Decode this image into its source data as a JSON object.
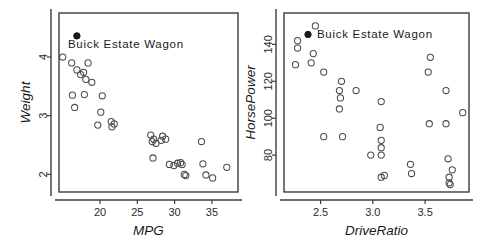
{
  "figure": {
    "background_color": "#ffffff",
    "point_stroke_color": "#4a4a4a",
    "highlight_color": "#1a1a1a",
    "axis_color": "#3c3c3c"
  },
  "chart_data": [
    {
      "type": "scatter",
      "title": "",
      "xlabel": "MPG",
      "ylabel": "Weight",
      "xlim": [
        14.5,
        38.5
      ],
      "ylim": [
        1.7,
        4.75
      ],
      "xticks": [
        20,
        25,
        30,
        35
      ],
      "yticks": [
        2,
        3,
        4
      ],
      "grid": false,
      "legend": {
        "label": "Buick Estate Wagon",
        "marker": "filled-circle",
        "position": "top-left-inside",
        "marker_below_text": true
      },
      "annotations": [
        {
          "label": "Buick Estate Wagon",
          "x": 16.9,
          "y": 4.36,
          "marker": "filled-circle"
        }
      ],
      "points": [
        {
          "x": 15.0,
          "y": 4.0
        },
        {
          "x": 16.2,
          "y": 3.9
        },
        {
          "x": 16.9,
          "y": 3.78
        },
        {
          "x": 17.4,
          "y": 3.7
        },
        {
          "x": 17.8,
          "y": 3.74
        },
        {
          "x": 18.4,
          "y": 3.9
        },
        {
          "x": 18.1,
          "y": 3.62
        },
        {
          "x": 18.9,
          "y": 3.57
        },
        {
          "x": 16.3,
          "y": 3.35
        },
        {
          "x": 17.9,
          "y": 3.36
        },
        {
          "x": 16.6,
          "y": 3.14
        },
        {
          "x": 20.3,
          "y": 3.34
        },
        {
          "x": 20.1,
          "y": 3.06
        },
        {
          "x": 19.7,
          "y": 2.84
        },
        {
          "x": 21.5,
          "y": 2.9
        },
        {
          "x": 21.9,
          "y": 2.86
        },
        {
          "x": 21.6,
          "y": 2.81
        },
        {
          "x": 26.8,
          "y": 2.67
        },
        {
          "x": 27.2,
          "y": 2.6
        },
        {
          "x": 27.0,
          "y": 2.56
        },
        {
          "x": 27.5,
          "y": 2.53
        },
        {
          "x": 28.4,
          "y": 2.65
        },
        {
          "x": 28.8,
          "y": 2.6
        },
        {
          "x": 28.2,
          "y": 2.58
        },
        {
          "x": 27.1,
          "y": 2.28
        },
        {
          "x": 29.3,
          "y": 2.17
        },
        {
          "x": 29.9,
          "y": 2.15
        },
        {
          "x": 30.4,
          "y": 2.19
        },
        {
          "x": 30.8,
          "y": 2.2
        },
        {
          "x": 31.0,
          "y": 2.17
        },
        {
          "x": 31.3,
          "y": 2.0
        },
        {
          "x": 31.5,
          "y": 1.98
        },
        {
          "x": 33.6,
          "y": 2.56
        },
        {
          "x": 33.8,
          "y": 2.18
        },
        {
          "x": 34.2,
          "y": 1.99
        },
        {
          "x": 35.1,
          "y": 1.94
        },
        {
          "x": 37.0,
          "y": 2.12
        }
      ]
    },
    {
      "type": "scatter",
      "title": "",
      "xlabel": "DriveRatio",
      "ylabel": "HorsePower",
      "xlim": [
        2.15,
        3.92
      ],
      "ylim": [
        60,
        157
      ],
      "xticks": [
        2.5,
        3.0,
        3.5
      ],
      "yticks": [
        80,
        100,
        120,
        140
      ],
      "grid": false,
      "legend": {
        "label": "Buick Estate Wagon",
        "marker": "filled-circle",
        "position": "top-right-inside",
        "marker_below_text": false
      },
      "points": [
        {
          "x": 2.28,
          "y": 142
        },
        {
          "x": 2.28,
          "y": 138
        },
        {
          "x": 2.26,
          "y": 129
        },
        {
          "x": 2.45,
          "y": 150
        },
        {
          "x": 2.43,
          "y": 135
        },
        {
          "x": 2.41,
          "y": 130
        },
        {
          "x": 2.53,
          "y": 125
        },
        {
          "x": 2.7,
          "y": 120
        },
        {
          "x": 2.68,
          "y": 115
        },
        {
          "x": 2.69,
          "y": 111
        },
        {
          "x": 2.68,
          "y": 105
        },
        {
          "x": 2.84,
          "y": 115
        },
        {
          "x": 2.53,
          "y": 90
        },
        {
          "x": 2.71,
          "y": 90
        },
        {
          "x": 3.08,
          "y": 109
        },
        {
          "x": 3.07,
          "y": 95
        },
        {
          "x": 3.08,
          "y": 88
        },
        {
          "x": 3.08,
          "y": 84
        },
        {
          "x": 3.08,
          "y": 80
        },
        {
          "x": 2.98,
          "y": 80
        },
        {
          "x": 3.08,
          "y": 68
        },
        {
          "x": 3.11,
          "y": 69
        },
        {
          "x": 3.36,
          "y": 75
        },
        {
          "x": 3.37,
          "y": 70
        },
        {
          "x": 3.55,
          "y": 133
        },
        {
          "x": 3.53,
          "y": 125
        },
        {
          "x": 3.54,
          "y": 97
        },
        {
          "x": 3.7,
          "y": 115
        },
        {
          "x": 3.7,
          "y": 97
        },
        {
          "x": 3.72,
          "y": 78
        },
        {
          "x": 3.76,
          "y": 72
        },
        {
          "x": 3.73,
          "y": 68
        },
        {
          "x": 3.73,
          "y": 65
        },
        {
          "x": 3.74,
          "y": 64
        },
        {
          "x": 3.86,
          "y": 103
        }
      ]
    }
  ]
}
